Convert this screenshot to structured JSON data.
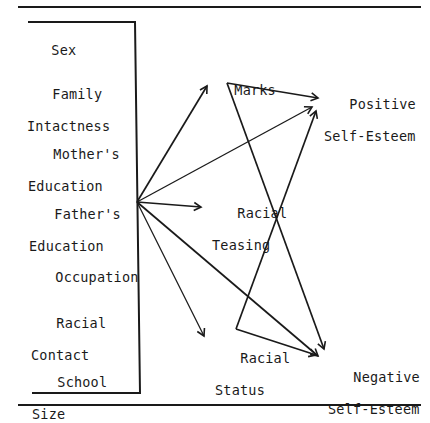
{
  "diagram": {
    "type": "path-diagram",
    "predictors": [
      {
        "id": "sex",
        "line1": "Sex",
        "line2": ""
      },
      {
        "id": "family",
        "line1": "Family",
        "line2": "Intactness"
      },
      {
        "id": "mother",
        "line1": "Mother's",
        "line2": "Education"
      },
      {
        "id": "father",
        "line1": "Father's",
        "line2": "Education"
      },
      {
        "id": "occupation",
        "line1": "Occupation",
        "line2": ""
      },
      {
        "id": "contact",
        "line1": "Racial",
        "line2": "Contact"
      },
      {
        "id": "school",
        "line1": "School",
        "line2": "Size"
      }
    ],
    "mediators": {
      "marks": {
        "line1": "Marks"
      },
      "teasing": {
        "line1": "Racial",
        "line2": "Teasing"
      },
      "status": {
        "line1": "Racial",
        "line2": "Status"
      }
    },
    "outcomes": {
      "positive": {
        "line1": "Positive",
        "line2": "Self-Esteem"
      },
      "negative": {
        "line1": "Negative",
        "line2": "Self-Esteem"
      }
    },
    "edges": [
      {
        "from": "predictors",
        "to": "Marks"
      },
      {
        "from": "predictors",
        "to": "Positive Self-Esteem"
      },
      {
        "from": "predictors",
        "to": "Racial Teasing"
      },
      {
        "from": "predictors",
        "to": "Negative Self-Esteem"
      },
      {
        "from": "predictors",
        "to": "Racial Status"
      },
      {
        "from": "Marks",
        "to": "Positive Self-Esteem"
      },
      {
        "from": "Marks",
        "to": "Negative Self-Esteem"
      },
      {
        "from": "Racial Status",
        "to": "Positive Self-Esteem"
      },
      {
        "from": "Racial Status",
        "to": "Negative Self-Esteem"
      }
    ],
    "colors": {
      "ink": "#1a1a1a",
      "background": "#ffffff"
    }
  }
}
